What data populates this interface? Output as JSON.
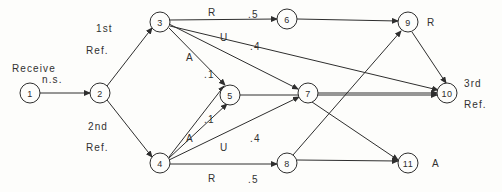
{
  "diagram": {
    "background_color": "#fdfdfb",
    "stroke_color": "#2e2e2e",
    "text_color": "#313131",
    "nodes": [
      {
        "id": "1",
        "label": "1",
        "cx": 30,
        "cy": 93,
        "r": 10
      },
      {
        "id": "2",
        "label": "2",
        "cx": 100,
        "cy": 93,
        "r": 10
      },
      {
        "id": "3",
        "label": "3",
        "cx": 160,
        "cy": 22,
        "r": 10
      },
      {
        "id": "4",
        "label": "4",
        "cx": 160,
        "cy": 163,
        "r": 10
      },
      {
        "id": "5",
        "label": "5",
        "cx": 230,
        "cy": 95,
        "r": 10
      },
      {
        "id": "6",
        "label": "6",
        "cx": 287,
        "cy": 19,
        "r": 10
      },
      {
        "id": "7",
        "label": "7",
        "cx": 308,
        "cy": 93,
        "r": 10
      },
      {
        "id": "8",
        "label": "8",
        "cx": 287,
        "cy": 163,
        "r": 10
      },
      {
        "id": "9",
        "label": "9",
        "cx": 408,
        "cy": 22,
        "r": 10
      },
      {
        "id": "10",
        "label": "10",
        "cx": 447,
        "cy": 93,
        "r": 10
      },
      {
        "id": "11",
        "label": "11",
        "cx": 408,
        "cy": 163,
        "r": 10
      }
    ],
    "edges": [
      {
        "id": "e1-2",
        "from": "1",
        "to": "2",
        "x1": 40,
        "y1": 93,
        "x2": 90,
        "y2": 93
      },
      {
        "id": "e2-3",
        "from": "2",
        "to": "3",
        "x1": 107,
        "y1": 86,
        "x2": 152,
        "y2": 28
      },
      {
        "id": "e2-4",
        "from": "2",
        "to": "4",
        "x1": 107,
        "y1": 100,
        "x2": 152,
        "y2": 157
      },
      {
        "id": "e3-6",
        "from": "3",
        "to": "6",
        "x1": 169,
        "y1": 20,
        "x2": 277,
        "y2": 19
      },
      {
        "id": "e3-7",
        "from": "3",
        "to": "7",
        "x1": 169,
        "y1": 24,
        "x2": 298,
        "y2": 89
      },
      {
        "id": "e3-5",
        "from": "3",
        "to": "5",
        "x1": 169,
        "y1": 28,
        "x2": 225,
        "y2": 85
      },
      {
        "id": "e3-10",
        "from": "3",
        "to": "10",
        "x1": 170,
        "y1": 26,
        "x2": 438,
        "y2": 90
      },
      {
        "id": "e4-5",
        "from": "4",
        "to": "5",
        "x1": 169,
        "y1": 158,
        "x2": 227,
        "y2": 104
      },
      {
        "id": "e4-3",
        "from": "4",
        "to": "3",
        "x1": 169,
        "y1": 157,
        "x2": 224,
        "y2": 86
      },
      {
        "id": "e4-7",
        "from": "4",
        "to": "7",
        "x1": 169,
        "y1": 160,
        "x2": 299,
        "y2": 97
      },
      {
        "id": "e4-8",
        "from": "4",
        "to": "8",
        "x1": 169,
        "y1": 164,
        "x2": 277,
        "y2": 164
      },
      {
        "id": "e6-9",
        "from": "6",
        "to": "9",
        "x1": 297,
        "y1": 19,
        "x2": 398,
        "y2": 21
      },
      {
        "id": "e5-10",
        "from": "5",
        "to": "10",
        "x1": 240,
        "y1": 95,
        "x2": 437,
        "y2": 95
      },
      {
        "id": "e7-10",
        "from": "7",
        "to": "10",
        "x1": 318,
        "y1": 93,
        "x2": 437,
        "y2": 93
      },
      {
        "id": "e7-11",
        "from": "7",
        "to": "11",
        "x1": 312,
        "y1": 102,
        "x2": 398,
        "y2": 160
      },
      {
        "id": "e8-9",
        "from": "8",
        "to": "9",
        "x1": 293,
        "y1": 155,
        "x2": 401,
        "y2": 31
      },
      {
        "id": "e8-11",
        "from": "8",
        "to": "11",
        "x1": 297,
        "y1": 160,
        "x2": 398,
        "y2": 161
      },
      {
        "id": "e9-10",
        "from": "9",
        "to": "10",
        "x1": 412,
        "y1": 32,
        "x2": 446,
        "y2": 83
      }
    ],
    "edge_labels": [
      {
        "id": "lbl-receive",
        "text": "Receive",
        "x": 12,
        "y": 62
      },
      {
        "id": "lbl-ns",
        "text": "n.s.",
        "x": 42,
        "y": 73
      },
      {
        "id": "lbl-1st",
        "text": "1st",
        "x": 96,
        "y": 22
      },
      {
        "id": "lbl-ref1",
        "text": "Ref.",
        "x": 86,
        "y": 44
      },
      {
        "id": "lbl-2nd",
        "text": "2nd",
        "x": 88,
        "y": 120
      },
      {
        "id": "lbl-ref2",
        "text": "Ref.",
        "x": 86,
        "y": 141
      },
      {
        "id": "lbl-r-top",
        "text": "R",
        "x": 208,
        "y": 6
      },
      {
        "id": "lbl-5-top",
        "text": ".5",
        "x": 248,
        "y": 8
      },
      {
        "id": "lbl-u-top",
        "text": "U",
        "x": 220,
        "y": 31
      },
      {
        "id": "lbl-4-top",
        "text": ".4",
        "x": 250,
        "y": 40
      },
      {
        "id": "lbl-a-top",
        "text": "A",
        "x": 186,
        "y": 51
      },
      {
        "id": "lbl-1-top",
        "text": ".1",
        "x": 204,
        "y": 68
      },
      {
        "id": "lbl-1-bot",
        "text": ".1",
        "x": 204,
        "y": 113
      },
      {
        "id": "lbl-a-bot",
        "text": "A",
        "x": 186,
        "y": 132
      },
      {
        "id": "lbl-u-bot",
        "text": "U",
        "x": 220,
        "y": 141
      },
      {
        "id": "lbl-4-bot",
        "text": ".4",
        "x": 250,
        "y": 132
      },
      {
        "id": "lbl-r-bot",
        "text": "R",
        "x": 208,
        "y": 172
      },
      {
        "id": "lbl-5-bot",
        "text": ".5",
        "x": 248,
        "y": 173
      }
    ],
    "node_side_labels": [
      {
        "id": "lbl-r-node9",
        "text": "R",
        "x": 427,
        "y": 16
      },
      {
        "id": "lbl-3rd",
        "text": "3rd",
        "x": 464,
        "y": 77
      },
      {
        "id": "lbl-ref3",
        "text": "Ref.",
        "x": 464,
        "y": 98
      },
      {
        "id": "lbl-a-node11",
        "text": "A",
        "x": 432,
        "y": 157
      }
    ]
  }
}
